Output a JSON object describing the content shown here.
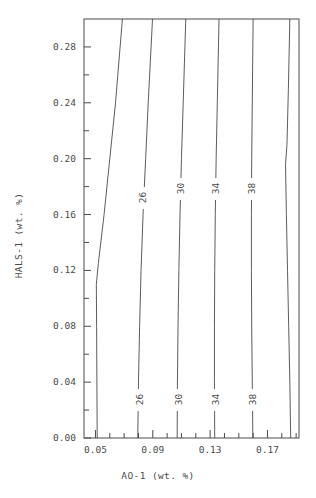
{
  "chart_data": {
    "type": "line",
    "subtype": "contour",
    "title": "",
    "xlabel": "AO-1 (wt. %)",
    "ylabel": "HALS-1 (wt. %)",
    "xlim": [
      0.042,
      0.192
    ],
    "ylim": [
      0.0,
      0.3
    ],
    "grid": false,
    "legend": "none",
    "x_major_ticks": [
      0.05,
      0.09,
      0.13,
      0.17
    ],
    "x_major_tick_labels": [
      "0.05",
      "0.09",
      "0.13",
      "0.17"
    ],
    "x_minor_tick_count_between": 3,
    "y_major_ticks": [
      0.0,
      0.04,
      0.08,
      0.12,
      0.16,
      0.2,
      0.24,
      0.28
    ],
    "y_major_tick_labels": [
      "0.00",
      "0.04",
      "0.08",
      "0.12",
      "0.16",
      "0.20",
      "0.24",
      "0.28"
    ],
    "y_minor_tick_count_between": 1,
    "contour_levels": [
      22,
      26,
      30,
      34,
      38,
      42
    ],
    "labeled_levels": [
      26,
      30,
      34,
      38
    ],
    "contours": [
      {
        "level": 22,
        "labeled": false,
        "points": [
          {
            "x": 0.0512,
            "y": 0.0
          },
          {
            "x": 0.051,
            "y": 0.04
          },
          {
            "x": 0.0508,
            "y": 0.08
          },
          {
            "x": 0.0506,
            "y": 0.11
          },
          {
            "x": 0.052,
            "y": 0.125
          },
          {
            "x": 0.056,
            "y": 0.16
          },
          {
            "x": 0.06,
            "y": 0.2
          },
          {
            "x": 0.064,
            "y": 0.24
          },
          {
            "x": 0.0672,
            "y": 0.28
          },
          {
            "x": 0.0688,
            "y": 0.3
          }
        ]
      },
      {
        "level": 26,
        "labeled": true,
        "points": [
          {
            "x": 0.0795,
            "y": 0.0
          },
          {
            "x": 0.08,
            "y": 0.04
          },
          {
            "x": 0.0808,
            "y": 0.08
          },
          {
            "x": 0.0818,
            "y": 0.12
          },
          {
            "x": 0.0832,
            "y": 0.16
          },
          {
            "x": 0.085,
            "y": 0.2
          },
          {
            "x": 0.0868,
            "y": 0.24
          },
          {
            "x": 0.0888,
            "y": 0.28
          },
          {
            "x": 0.0898,
            "y": 0.3
          }
        ]
      },
      {
        "level": 30,
        "labeled": true,
        "points": [
          {
            "x": 0.107,
            "y": 0.0
          },
          {
            "x": 0.1072,
            "y": 0.04
          },
          {
            "x": 0.1076,
            "y": 0.08
          },
          {
            "x": 0.1082,
            "y": 0.12
          },
          {
            "x": 0.109,
            "y": 0.16
          },
          {
            "x": 0.11,
            "y": 0.2
          },
          {
            "x": 0.1112,
            "y": 0.24
          },
          {
            "x": 0.1124,
            "y": 0.28
          },
          {
            "x": 0.113,
            "y": 0.3
          }
        ]
      },
      {
        "level": 34,
        "labeled": true,
        "points": [
          {
            "x": 0.1332,
            "y": 0.0
          },
          {
            "x": 0.133,
            "y": 0.04
          },
          {
            "x": 0.133,
            "y": 0.08
          },
          {
            "x": 0.1332,
            "y": 0.12
          },
          {
            "x": 0.1336,
            "y": 0.16
          },
          {
            "x": 0.1342,
            "y": 0.2
          },
          {
            "x": 0.135,
            "y": 0.24
          },
          {
            "x": 0.1358,
            "y": 0.28
          },
          {
            "x": 0.1362,
            "y": 0.3
          }
        ]
      },
      {
        "level": 38,
        "labeled": true,
        "points": [
          {
            "x": 0.1598,
            "y": 0.0
          },
          {
            "x": 0.1594,
            "y": 0.04
          },
          {
            "x": 0.159,
            "y": 0.08
          },
          {
            "x": 0.1588,
            "y": 0.12
          },
          {
            "x": 0.1588,
            "y": 0.16
          },
          {
            "x": 0.159,
            "y": 0.2
          },
          {
            "x": 0.1594,
            "y": 0.24
          },
          {
            "x": 0.1598,
            "y": 0.28
          },
          {
            "x": 0.16,
            "y": 0.3
          }
        ]
      },
      {
        "level": 42,
        "labeled": false,
        "points": [
          {
            "x": 0.1862,
            "y": 0.0
          },
          {
            "x": 0.1856,
            "y": 0.04
          },
          {
            "x": 0.1848,
            "y": 0.08
          },
          {
            "x": 0.184,
            "y": 0.12
          },
          {
            "x": 0.1832,
            "y": 0.16
          },
          {
            "x": 0.1826,
            "y": 0.196
          },
          {
            "x": 0.1836,
            "y": 0.21
          },
          {
            "x": 0.1846,
            "y": 0.25
          },
          {
            "x": 0.1856,
            "y": 0.3
          }
        ]
      }
    ],
    "contour_inline_labels": [
      {
        "text": "26",
        "x": 0.0828,
        "y": 0.172
      },
      {
        "text": "30",
        "x": 0.1088,
        "y": 0.178
      },
      {
        "text": "34",
        "x": 0.1336,
        "y": 0.178
      },
      {
        "text": "38",
        "x": 0.1588,
        "y": 0.178
      },
      {
        "text": "26",
        "x": 0.0802,
        "y": 0.027
      },
      {
        "text": "30",
        "x": 0.1073,
        "y": 0.027
      },
      {
        "text": "34",
        "x": 0.1331,
        "y": 0.027
      },
      {
        "text": "38",
        "x": 0.1595,
        "y": 0.027
      }
    ],
    "colors": {
      "line": "#4a4a4a",
      "axis": "#4a4a4a",
      "text": "#4a4a4a",
      "background": "#ffffff"
    }
  }
}
